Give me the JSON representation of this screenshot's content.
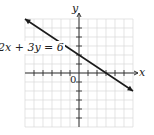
{
  "figure": {
    "equation_label": "2x + 3y = 6",
    "x_axis_label": "x",
    "y_axis_label": "y",
    "origin_label": "0"
  },
  "chart_data": {
    "type": "line",
    "title": "",
    "equation": "2x + 3y = 6",
    "xlabel": "x",
    "ylabel": "y",
    "xlim": [
      -6,
      6
    ],
    "ylim": [
      -6,
      6
    ],
    "grid": true,
    "series": [
      {
        "name": "2x + 3y = 6",
        "x": [
          -6,
          6
        ],
        "y": [
          6,
          -2
        ],
        "arrows_both_ends": true
      }
    ],
    "intercepts": {
      "x_intercept": [
        3,
        0
      ],
      "y_intercept": [
        0,
        2
      ]
    },
    "annotations": [
      {
        "text": "0",
        "at": [
          0,
          0
        ]
      }
    ]
  },
  "colors": {
    "grid": "#d9d9d9",
    "axes": "#333333",
    "line": "#1a1a1a"
  }
}
